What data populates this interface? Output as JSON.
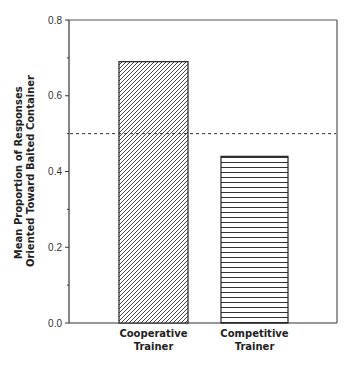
{
  "chart_data": {
    "type": "bar",
    "title": "",
    "xlabel": "",
    "ylabel": [
      "Mean Proportion of Responses",
      "Oriented Toward Baited Container"
    ],
    "ylim": [
      0.0,
      0.8
    ],
    "yticks": [
      "0.0",
      "0.2",
      "0.4",
      "0.6",
      "0.8"
    ],
    "minor_ticks": [
      0.1,
      0.3,
      0.5,
      0.7
    ],
    "categories": [
      {
        "line1": "Cooperative",
        "line2": "Trainer"
      },
      {
        "line1": "Competitive",
        "line2": "Trainer"
      }
    ],
    "values": [
      0.69,
      0.44
    ],
    "patterns": [
      "diagonal-hatch",
      "horizontal-lines"
    ],
    "reference_line": {
      "value": 0.5,
      "style": "dashed"
    },
    "grid": false,
    "legend": null
  }
}
